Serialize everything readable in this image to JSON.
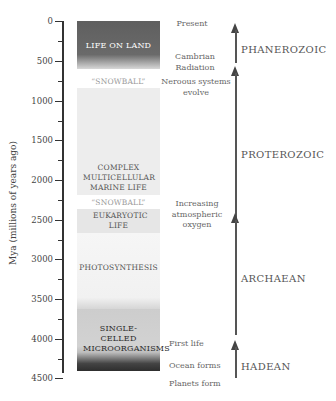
{
  "axis": {
    "label": "Mya (millions of years ago)",
    "ticks": [
      "0",
      "500",
      "1000",
      "1500",
      "2000",
      "2500",
      "3000",
      "3500",
      "4000",
      "4500"
    ],
    "range": [
      0,
      4600
    ],
    "direction": "top-to-bottom"
  },
  "column_bands": [
    {
      "label": "LIFE ON LAND",
      "start_mya": 0,
      "end_mya": 540,
      "color": "#6a6a6a",
      "text_color": "#ffffff"
    },
    {
      "label": "“SNOWBALL”",
      "start_mya": 600,
      "end_mya": 800,
      "color": "#ffffff",
      "text_color": "#9a9a9a"
    },
    {
      "label": "COMPLEX MULTICELLULAR MARINE LIFE",
      "start_mya": 800,
      "end_mya": 2150,
      "color": "#ececec",
      "text_color": "#555555"
    },
    {
      "label": "“SNOWBALL”",
      "start_mya": 2150,
      "end_mya": 2350,
      "color": "#ffffff",
      "text_color": "#9a9a9a"
    },
    {
      "label": "EUKARYOTIC LIFE",
      "start_mya": 2350,
      "end_mya": 2700,
      "color": "#e8e8e8",
      "text_color": "#555555"
    },
    {
      "label": "PHOTOSYNTHESIS",
      "start_mya": 2700,
      "end_mya": 3500,
      "color": "#f3f3f3",
      "text_color": "#666666"
    },
    {
      "label": "SINGLE-CELLED MICROORGANISMS",
      "start_mya": 3600,
      "end_mya": 4300,
      "color": "#cfcfcf",
      "text_color": "#333333"
    },
    {
      "label": "",
      "start_mya": 4300,
      "end_mya": 4600,
      "color": "#3a3a3a",
      "text_color": "#ffffff"
    }
  ],
  "events": [
    {
      "label": "Present",
      "mya": 0
    },
    {
      "label": "Cambrian Radiation",
      "mya": 540
    },
    {
      "label": "Neroous systems evolve",
      "mya": 650
    },
    {
      "label": "Increasing atmospheric oxygen",
      "mya": 2450
    },
    {
      "label": "First life",
      "mya": 4000
    },
    {
      "label": "Ocean forms",
      "mya": 4350
    },
    {
      "label": "Planets form",
      "mya": 4550
    }
  ],
  "eons": [
    {
      "name": "PHANEROZOIC",
      "start_mya": 541,
      "end_mya": 0
    },
    {
      "name": "PROTEROZOIC",
      "start_mya": 2500,
      "end_mya": 541
    },
    {
      "name": "ARCHAEAN",
      "start_mya": 4000,
      "end_mya": 2500
    },
    {
      "name": "HADEAN",
      "start_mya": 4600,
      "end_mya": 4000
    }
  ]
}
